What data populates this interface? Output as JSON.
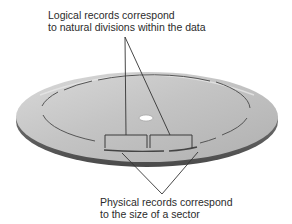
{
  "diagram": {
    "top_label": {
      "line1": "Logical records correspond",
      "line2": "to natural divisions within the data"
    },
    "bottom_label": {
      "line1": "Physical records correspond",
      "line2": "to the size of a sector"
    },
    "elements": {
      "disk": "magnetic-disk-platter",
      "logical_record_brackets": 2,
      "physical_sector_arcs": 2
    },
    "colors": {
      "disk_top": "#c9c9c9",
      "disk_rim": "#6f6f6f",
      "track": "#555555",
      "leader_lines": "#333333",
      "text": "#2b2b2b"
    }
  }
}
